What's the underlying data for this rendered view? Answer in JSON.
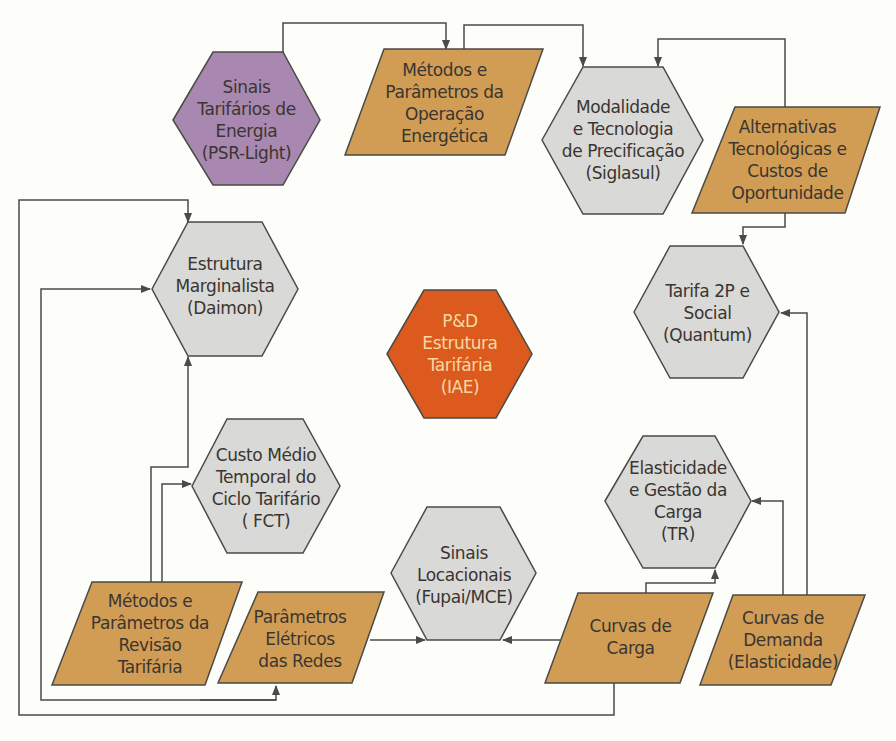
{
  "diagram": {
    "title": "P&D Estrutura Tarifária",
    "colors": {
      "hex_gray": "#d9d9d7",
      "para_orange": "#d19d55",
      "hex_purple": "#a888b0",
      "hex_center": "#dc5a1e",
      "stroke": "#4a4a46",
      "background": "#fdfdfa"
    },
    "nodes": {
      "sinais_tarifarios": {
        "lines": [
          "Sinais",
          "Tarifários de",
          "Energia",
          "(PSR-Light)"
        ]
      },
      "metodos_operacao": {
        "lines": [
          "Métodos e",
          "Parâmetros da",
          "Operação",
          "Energética"
        ]
      },
      "modalidade": {
        "lines": [
          "Modalidade",
          "e Tecnologia",
          "de Precificação",
          "(Siglasul)"
        ]
      },
      "alternativas": {
        "lines": [
          "Alternativas",
          "Tecnológicas e",
          "Custos de",
          "Oportunidade"
        ]
      },
      "estrutura_marginalista": {
        "lines": [
          "Estrutura",
          "Marginalista",
          "(Daimon)"
        ]
      },
      "center": {
        "lines": [
          "P&D",
          "Estrutura",
          "Tarifária",
          "(IAE)"
        ]
      },
      "tarifa_2p": {
        "lines": [
          "Tarifa 2P e",
          "Social",
          "(Quantum)"
        ]
      },
      "custo_medio": {
        "lines": [
          "Custo Médio",
          "Temporal do",
          "Ciclo Tarifário",
          "( FCT)"
        ]
      },
      "elasticidade": {
        "lines": [
          "Elasticidade",
          "e Gestão da",
          "Carga",
          "(TR)"
        ]
      },
      "sinais_locacionais": {
        "lines": [
          "Sinais",
          "Locacionais",
          "(Fupai/MCE)"
        ]
      },
      "metodos_revisao": {
        "lines": [
          "Métodos e",
          "Parâmetros da",
          "Revisão",
          "Tarifária"
        ]
      },
      "parametros_eletricos": {
        "lines": [
          "Parâmetros",
          "Elétricos",
          "das Redes"
        ]
      },
      "curvas_carga": {
        "lines": [
          "Curvas de",
          "Carga"
        ]
      },
      "curvas_demanda": {
        "lines": [
          "Curvas de",
          "Demanda",
          "(Elasticidade)"
        ]
      }
    }
  }
}
